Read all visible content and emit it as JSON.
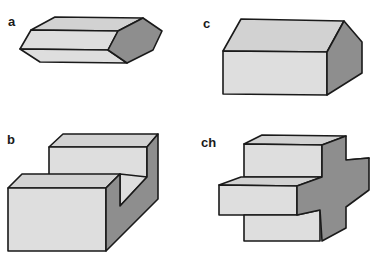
{
  "figure": {
    "colors": {
      "light_face": "#dedede",
      "top_face": "#d2d2d2",
      "shaded_face": "#8e8e8e",
      "outline": "#1a1a1a"
    },
    "panels": [
      {
        "label": "a",
        "shape": "hexagonal prism"
      },
      {
        "label": "c",
        "shape": "pentagonal prism (house shape)"
      },
      {
        "label": "b",
        "shape": "block with rectangular notch"
      },
      {
        "label": "ch",
        "shape": "cross-shaped prism"
      }
    ]
  }
}
